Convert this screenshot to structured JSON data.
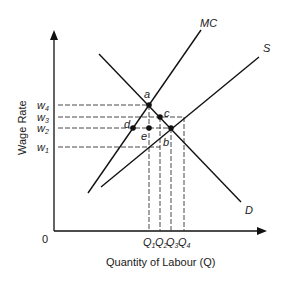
{
  "diagram": {
    "x_axis_label": "Quantity of Labour (Q)",
    "y_axis_label": "Wage Rate",
    "origin_label": "0",
    "curves": {
      "mc": "MC",
      "s": "S",
      "d": "D"
    },
    "points": {
      "a": "a",
      "b": "b",
      "c": "c",
      "d": "d",
      "e": "e"
    },
    "wages": [
      "w4",
      "w3",
      "w2",
      "w1"
    ],
    "quantities": [
      "Q1",
      "Q2",
      "Q3",
      "Q4"
    ]
  }
}
